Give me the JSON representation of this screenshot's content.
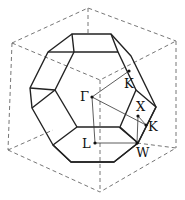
{
  "figure": {
    "labels": {
      "gamma": "Γ",
      "k_upper": "K",
      "x": "X",
      "k_lower": "K",
      "l": "L",
      "w": "W"
    },
    "high_symmetry_points": [
      "Γ",
      "K",
      "X",
      "K",
      "L",
      "W"
    ],
    "colors": {
      "solid_edges": "#222222",
      "dashed_edges": "#666666",
      "background": "#ffffff"
    }
  }
}
